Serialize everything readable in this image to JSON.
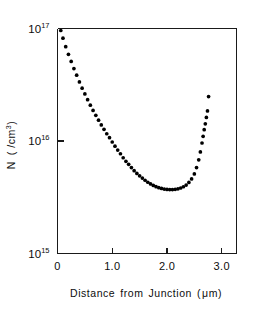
{
  "figure": {
    "background_color": "#ffffff",
    "ink_color": "#000000",
    "frame_color": "#1a1a1a"
  },
  "axis_labels": {
    "x_title_parts": [
      "Distance",
      "from",
      "Junction",
      "(",
      "μm",
      ")"
    ],
    "x_title": "Distance  from  Junction ( μm)",
    "y_title_main": "N",
    "y_title_unit_open": "( /cm",
    "y_title_unit_exp": "3",
    "y_title_unit_close": ")",
    "y_title": "N ( /cm3)"
  },
  "x_ticks": [
    {
      "value": 0.0,
      "label": "0"
    },
    {
      "value": 1.0,
      "label": "1.0"
    },
    {
      "value": 2.0,
      "label": "2.0"
    },
    {
      "value": 3.0,
      "label": "3.0"
    }
  ],
  "y_ticks": [
    {
      "value": 1000000000000000.0,
      "base": "10",
      "exponent": "15"
    },
    {
      "value": 1e+16,
      "base": "10",
      "exponent": "16"
    },
    {
      "value": 1e+17,
      "base": "10",
      "exponent": "17"
    }
  ],
  "chart_data": {
    "type": "scatter",
    "title": "",
    "subtitle": "",
    "xlabel": "Distance  from  Junction ( μm)",
    "ylabel": "N ( /cm3)",
    "xlim": [
      0.0,
      3.27
    ],
    "ylim": [
      1000000000000000.0,
      1e+17
    ],
    "yscale": "log",
    "xscale": "linear",
    "grid": false,
    "legend": null,
    "marker": "filled-circle",
    "marker_color": "#000000",
    "series": [
      {
        "name": "Carrier concentration profile",
        "x": [
          0.06,
          0.1,
          0.15,
          0.2,
          0.25,
          0.3,
          0.35,
          0.4,
          0.45,
          0.5,
          0.55,
          0.6,
          0.65,
          0.7,
          0.75,
          0.8,
          0.85,
          0.9,
          0.95,
          1.0,
          1.05,
          1.1,
          1.15,
          1.2,
          1.25,
          1.3,
          1.35,
          1.4,
          1.45,
          1.5,
          1.55,
          1.6,
          1.65,
          1.7,
          1.75,
          1.8,
          1.85,
          1.9,
          1.95,
          2.0,
          2.05,
          2.1,
          2.15,
          2.2,
          2.25,
          2.3,
          2.35,
          2.4,
          2.45,
          2.5,
          2.54,
          2.58,
          2.61,
          2.64,
          2.66,
          2.68,
          2.7,
          2.72,
          2.74,
          2.76
        ],
        "y": [
          9.6e+16,
          8.2e+16,
          6.9e+16,
          5.9e+16,
          5.1e+16,
          4.4e+16,
          3.85e+16,
          3.35e+16,
          2.95e+16,
          2.62e+16,
          2.33e+16,
          2.08e+16,
          1.87e+16,
          1.69e+16,
          1.53e+16,
          1.39e+16,
          1.27e+16,
          1.16e+16,
          1.07e+16,
          9800000000000000.0,
          9000000000000000.0,
          8300000000000000.0,
          7700000000000000.0,
          7100000000000000.0,
          6600000000000000.0,
          6200000000000000.0,
          5800000000000000.0,
          5450000000000000.0,
          5150000000000000.0,
          4900000000000000.0,
          4680000000000000.0,
          4480000000000000.0,
          4300000000000000.0,
          4150000000000000.0,
          4030000000000000.0,
          3930000000000000.0,
          3850000000000000.0,
          3790000000000000.0,
          3740000000000000.0,
          3710000000000000.0,
          3700000000000000.0,
          3700000000000000.0,
          3720000000000000.0,
          3760000000000000.0,
          3820000000000000.0,
          3920000000000000.0,
          4060000000000000.0,
          4280000000000000.0,
          4600000000000000.0,
          5100000000000000.0,
          5800000000000000.0,
          6800000000000000.0,
          8000000000000000.0,
          9600000000000000.0,
          1.1e+16,
          1.26e+16,
          1.42e+16,
          1.62e+16,
          1.85e+16,
          2.48e+16
        ]
      }
    ]
  }
}
